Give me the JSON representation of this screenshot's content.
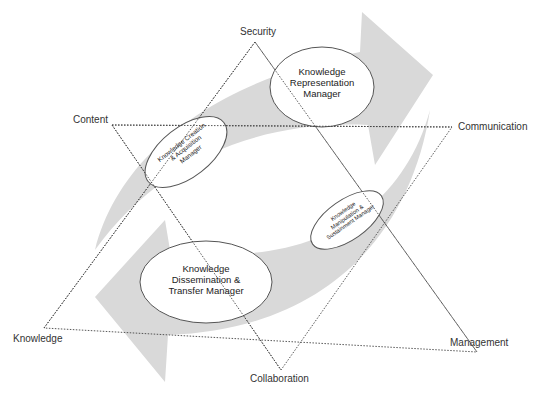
{
  "diagram": {
    "vertices": {
      "top": "Security",
      "upper_left": "Content",
      "upper_right": "Communication",
      "lower_left": "Knowledge",
      "lower_right": "Management",
      "bottom": "Collaboration"
    },
    "managers": {
      "representation": "Knowledge Representation Manager",
      "creation": "Knowledge Creation & Acquisition Manager",
      "manipulation": "Knowledge Manipulation & Sustainment Manager",
      "dissemination": "Knowledge Dissemination & Transfer Manager"
    },
    "manager_lines": {
      "representation": [
        "Knowledge",
        "Representation",
        "Manager"
      ],
      "creation": [
        "Knowledge Creation",
        "& Acquisition",
        "Manager"
      ],
      "manipulation": [
        "Knowledge",
        "Manipulation &",
        "Sustainment Manager"
      ],
      "dissemination": [
        "Knowledge",
        "Dissemination &",
        "Transfer Manager"
      ]
    },
    "colors": {
      "arrow_fill": "#d9d9d9",
      "line": "#444444",
      "ellipse_stroke": "#555555"
    }
  }
}
